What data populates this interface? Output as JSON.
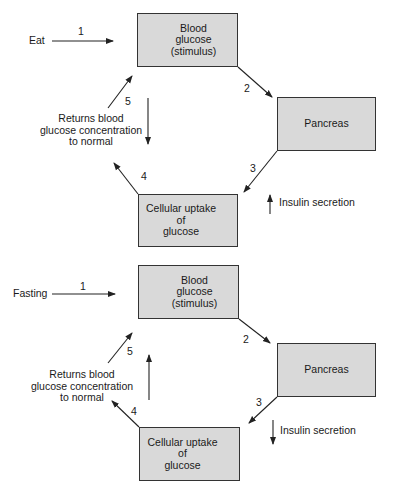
{
  "diagrams": [
    {
      "name": "eating",
      "trigger": "Eat",
      "stimulus_box": {
        "line1": "Blood",
        "line2": "glucose",
        "line3": "(stimulus)",
        "direction": "up"
      },
      "organ_box": {
        "label": "Pancreas"
      },
      "response_box": {
        "line1": "Cellular uptake",
        "line2": "of",
        "line3": "glucose",
        "direction": "up"
      },
      "secretion": {
        "label": "Insulin secretion",
        "direction": "up"
      },
      "return_label": {
        "line1": "Returns blood",
        "line2": "glucose concentration",
        "line3": "to normal"
      },
      "return_arrow_direction": "down",
      "steps": [
        "1",
        "2",
        "3",
        "4",
        "5"
      ]
    },
    {
      "name": "fasting",
      "trigger": "Fasting",
      "stimulus_box": {
        "line1": "Blood",
        "line2": "glucose",
        "line3": "(stimulus)",
        "direction": "down"
      },
      "organ_box": {
        "label": "Pancreas"
      },
      "response_box": {
        "line1": "Cellular uptake",
        "line2": "of",
        "line3": "glucose",
        "direction": "down"
      },
      "secretion": {
        "label": "Insulin secretion",
        "direction": "down"
      },
      "return_label": {
        "line1": "Returns blood",
        "line2": "glucose concentration",
        "line3": "to normal"
      },
      "return_arrow_direction": "up",
      "steps": [
        "1",
        "2",
        "3",
        "4",
        "5"
      ]
    }
  ],
  "colors": {
    "box_fill": "#d9d9d9",
    "stroke": "#222222"
  }
}
